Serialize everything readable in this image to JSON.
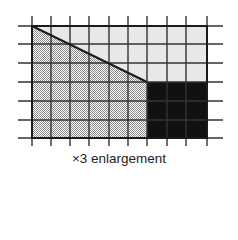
{
  "figure": {
    "caption": "×3 enlargement",
    "grid": {
      "columns": 9,
      "rows": 6,
      "origin_x": 32,
      "origin_y": 26,
      "cell_w": 19.4,
      "cell_h": 18.7,
      "tick_extension": 9
    },
    "regions": [
      {
        "name": "light-region",
        "fill": "#e8e8e8",
        "shape": "polygon above diagonal, upper-right area"
      },
      {
        "name": "stippled-region",
        "fill": "stipple",
        "shape": "trapezoid below diagonal, left area"
      },
      {
        "name": "dark-region",
        "fill": "#111111",
        "shape": "rectangle lower-right, 3 columns × 3 rows"
      }
    ],
    "colors": {
      "grid_line": "#333333",
      "light_fill": "#e8e8e8",
      "dark_fill": "#111111",
      "stipple_dot": "#8a8a8a",
      "outline": "#222222"
    }
  }
}
